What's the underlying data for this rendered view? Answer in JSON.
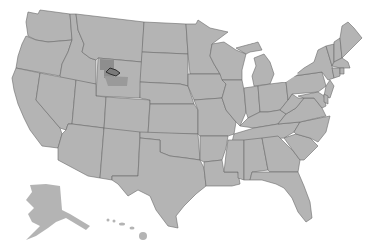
{
  "map": {
    "title": "United States",
    "subject": "US states map with highlighted area in northwestern Wyoming",
    "colors": {
      "land": "#b4b4b4",
      "border": "#6a6a6a",
      "highlight_region": "#8e8e8e",
      "highlight_shape": "#7a7a7a",
      "highlight_outline": "#2e2e2e",
      "water": "#ffffff"
    },
    "highlighted": {
      "state": "Wyoming",
      "area": "Northwest Wyoming (Yellowstone area)"
    },
    "insets": [
      "Alaska",
      "Hawaii"
    ]
  }
}
